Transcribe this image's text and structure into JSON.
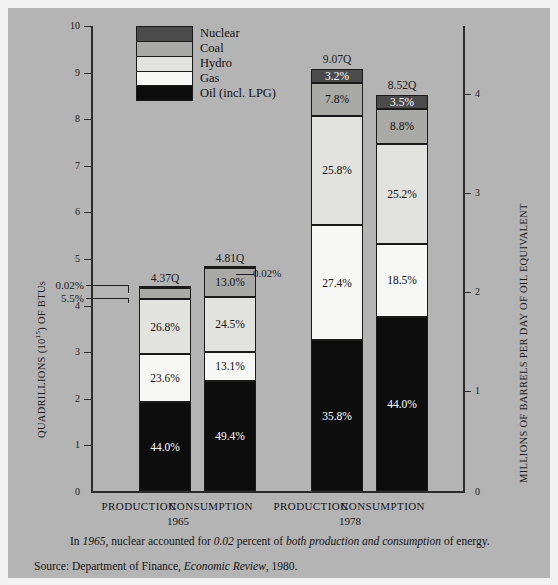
{
  "chart_data": {
    "type": "bar",
    "title": "",
    "subtype": "stacked-bar-percent",
    "categories": [
      "PRODUCTION",
      "CONSUMPTION",
      "PRODUCTION",
      "CONSUMPTION"
    ],
    "groups": [
      {
        "label": "1965",
        "bars": [
          0,
          1
        ]
      },
      {
        "label": "1978",
        "bars": [
          2,
          3
        ]
      }
    ],
    "series": [
      {
        "name": "Oil (incl. LPG)",
        "color": "#0d0d0d",
        "label_color": "#ffffff",
        "values": [
          44.0,
          49.4,
          35.8,
          44.0
        ]
      },
      {
        "name": "Gas",
        "color": "#f7f7f5",
        "label_color": "#111111",
        "values": [
          23.6,
          13.1,
          27.4,
          18.5
        ]
      },
      {
        "name": "Hydro",
        "color": "#e2e2de",
        "label_color": "#111111",
        "values": [
          26.8,
          24.5,
          25.8,
          25.2
        ]
      },
      {
        "name": "Coal",
        "color": "#a9a9a5",
        "label_color": "#111111",
        "values": [
          5.5,
          13.0,
          7.8,
          8.8
        ]
      },
      {
        "name": "Nuclear",
        "color": "#4b4b4b",
        "label_color": "#ffffff",
        "values": [
          0.02,
          0.02,
          3.2,
          3.5
        ]
      }
    ],
    "bar_totals": [
      "4.37Q",
      "4.81Q",
      "9.07Q",
      "8.52Q"
    ],
    "bar_total_values": [
      4.37,
      4.81,
      9.07,
      8.52
    ],
    "segment_labels": [
      [
        "44.0%",
        "23.6%",
        "26.8%",
        "5.5%",
        "0.02%"
      ],
      [
        "49.4%",
        "13.1%",
        "24.5%",
        "13.0%",
        "0.02%"
      ],
      [
        "35.8%",
        "27.4%",
        "25.8%",
        "7.8%",
        "3.2%"
      ],
      [
        "44.0%",
        "18.5%",
        "25.2%",
        "8.8%",
        "3.5%"
      ]
    ],
    "callouts": [
      {
        "text": "0.02%",
        "series": "Nuclear",
        "bar": 0
      },
      {
        "text": "5.5%",
        "series": "Coal",
        "bar": 0
      },
      {
        "text": "0.02%",
        "series": "Nuclear",
        "bar": 1
      }
    ],
    "ylabel": "QUADRILLIONS (1015) OF BTUs",
    "ylabel_left_main": "QUADRILLIONS (10",
    "ylabel_left_sup": "15",
    "ylabel_left_tail": ") OF BTUs",
    "ylim": [
      0,
      10
    ],
    "yticks": [
      "0",
      "1",
      "2",
      "3",
      "4",
      "5",
      "6",
      "7",
      "8",
      "9",
      "10"
    ],
    "y2label": "MILLIONS OF BARRELS PER DAY OF OIL EQUIVALENT",
    "y2lim": [
      0,
      4.29
    ],
    "y2ticks": [
      "0",
      "1",
      "2",
      "3",
      "4"
    ],
    "grid": false,
    "legend_position": "top-center",
    "legend_entries": [
      "Nuclear",
      "Coal",
      "Hydro",
      "Gas",
      "Oil (incl. LPG)"
    ]
  },
  "footnote": {
    "pre": "In ",
    "year": "1965",
    "mid": ", nuclear accounted for ",
    "value": "0.02",
    "mid2": " percent of ",
    "emphasis": "both production and consumption",
    "post": " of energy."
  },
  "source": {
    "prefix": "Source:  Department of Finance, ",
    "publication": "Economic Review",
    "suffix": ", 1980."
  }
}
